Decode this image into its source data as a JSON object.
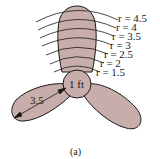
{
  "figure": {
    "caption": "(a)",
    "hub_label": "1 ft",
    "blade_length_label": "3.5",
    "radius_labels": [
      {
        "text": "r = 4.5",
        "y": 21
      },
      {
        "text": "r = 4",
        "y": 30
      },
      {
        "text": "r = 3.5",
        "y": 39
      },
      {
        "text": "r = 3",
        "y": 48
      },
      {
        "text": "r = 2.5",
        "y": 57
      },
      {
        "text": "r = 2",
        "y": 66
      },
      {
        "text": "r = 1.5",
        "y": 75
      }
    ],
    "colors": {
      "blade_fill": "#c8aeab",
      "outline": "#1a1a1a",
      "background": "#ffffff"
    }
  }
}
